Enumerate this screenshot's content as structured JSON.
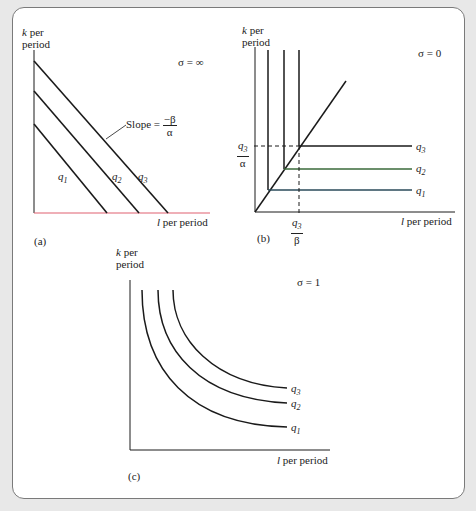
{
  "panels": {
    "a": {
      "tag": "(a)",
      "sigma": "σ = ∞",
      "y_label_1": "k",
      "y_label_2": " per",
      "y_label_3": "period",
      "x_label_1": "l",
      "x_label_2": " per period",
      "slope_label": "Slope = ",
      "slope_num": "−β",
      "slope_den": "α",
      "curves": [
        "q",
        "q",
        "q"
      ],
      "subs": [
        "1",
        "2",
        "3"
      ]
    },
    "b": {
      "tag": "(b)",
      "sigma": "σ = 0",
      "y_label_1": "k",
      "y_label_2": " per",
      "y_label_3": "period",
      "x_label_1": "l",
      "x_label_2": " per period",
      "y_tick_num": "q",
      "y_tick_sub": "3",
      "y_tick_den": "α",
      "x_tick_num": "q",
      "x_tick_sub": "3",
      "x_tick_den": "β",
      "curves": [
        "q",
        "q",
        "q"
      ],
      "subs": [
        "1",
        "2",
        "3"
      ]
    },
    "c": {
      "tag": "(c)",
      "sigma": "σ = 1",
      "y_label_1": "k",
      "y_label_2": " per",
      "y_label_3": "period",
      "x_label_1": "l",
      "x_label_2": " per period",
      "curves": [
        "q",
        "q",
        "q"
      ],
      "subs": [
        "1",
        "2",
        "3"
      ]
    }
  },
  "colors": {
    "line": "#1a1a1a",
    "axis_a": "#e05a6a",
    "q2_b": "#3a7a3a",
    "q1_b": "#2a4a6a"
  }
}
